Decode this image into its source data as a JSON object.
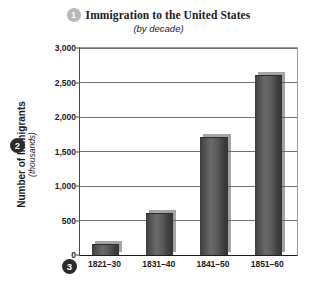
{
  "badges": {
    "title_badge": "1",
    "yaxis_badge": "2",
    "xaxis_badge": "3"
  },
  "colors": {
    "bar_dark": "#3c3c3c",
    "bar_mid": "#6a6a6a",
    "gridline": "#6f6f6f",
    "axis": "#1a1a1a",
    "badge_light": "#b8b8b8",
    "badge_dark": "#2b2b2b",
    "background": "#ffffff"
  },
  "chart_data": {
    "type": "bar",
    "title": "Immigration to the United States",
    "subtitle": "(by decade)",
    "xlabel": "",
    "ylabel": "Number of Immigrants",
    "ylabel_sub": "(thousands)",
    "categories": [
      "1821–30",
      "1831–40",
      "1841–50",
      "1851–60"
    ],
    "values": [
      150,
      600,
      1700,
      2600
    ],
    "ylim": [
      0,
      3000
    ],
    "ytick_values": [
      0,
      500,
      1000,
      1500,
      2000,
      2500,
      3000
    ],
    "ytick_labels": [
      "0",
      "500",
      "1,000",
      "1,500",
      "2,000",
      "2,500",
      "3,000"
    ],
    "grid": true,
    "legend": false
  }
}
